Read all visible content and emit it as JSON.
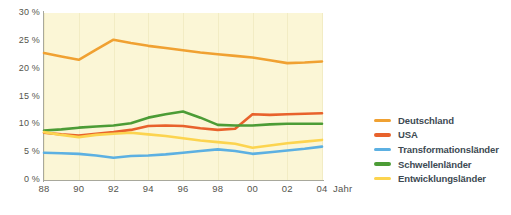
{
  "axes": {
    "y_ticks": [
      "30 %",
      "25 %",
      "20 %",
      "15 %",
      "10 %",
      "5 %",
      "0 %"
    ],
    "x_ticks": [
      "88",
      "90",
      "92",
      "94",
      "96",
      "98",
      "00",
      "02",
      "04"
    ],
    "x_title": "Jahr"
  },
  "legend": {
    "items": [
      {
        "label": "Deutschland",
        "color": "#f0a132"
      },
      {
        "label": "USA",
        "color": "#e8622c"
      },
      {
        "label": "Transformationsländer",
        "color": "#5cb0e2"
      },
      {
        "label": "Schwellenländer",
        "color": "#4c9c36"
      },
      {
        "label": "Entwicklungsländer",
        "color": "#fcd44f"
      }
    ]
  },
  "colors": {
    "plot_background": "#fbf6d6",
    "axis": "#a8a89c",
    "tick_text": "#55554d",
    "legend_text": "#3d4a52",
    "page_background": "#ffffff"
  },
  "chart_data": {
    "type": "line",
    "title": "",
    "xlabel": "Jahr",
    "ylabel": "",
    "grid": false,
    "legend_position": "right",
    "xlim": [
      1988,
      2004
    ],
    "ylim": [
      0,
      30
    ],
    "y_tick_values": [
      0,
      5,
      10,
      15,
      20,
      25,
      30
    ],
    "y_tick_labels": [
      "0 %",
      "5 %",
      "10 %",
      "15 %",
      "20 %",
      "25 %",
      "30 %"
    ],
    "x_tick_values": [
      1988,
      1990,
      1992,
      1994,
      1996,
      1998,
      2000,
      2002,
      2004
    ],
    "x_tick_labels": [
      "88",
      "90",
      "92",
      "94",
      "96",
      "98",
      "00",
      "02",
      "04"
    ],
    "x": [
      1988,
      1989,
      1990,
      1991,
      1992,
      1993,
      1994,
      1995,
      1996,
      1997,
      1998,
      1999,
      2000,
      2001,
      2002,
      2003,
      2004
    ],
    "series": [
      {
        "name": "Deutschland",
        "color": "#f0a132",
        "values": [
          22.8,
          22.2,
          21.6,
          23.4,
          25.2,
          24.6,
          24.1,
          23.7,
          23.3,
          22.9,
          22.6,
          22.3,
          22.0,
          21.5,
          21.0,
          21.1,
          21.3
        ]
      },
      {
        "name": "USA",
        "color": "#e8622c",
        "values": [
          8.5,
          8.2,
          8.0,
          8.3,
          8.6,
          9.0,
          9.7,
          9.8,
          9.7,
          9.3,
          9.0,
          9.2,
          11.8,
          11.7,
          11.8,
          11.9,
          12.0
        ]
      },
      {
        "name": "Transformationsländer",
        "color": "#5cb0e2",
        "values": [
          4.9,
          4.8,
          4.7,
          4.4,
          4.0,
          4.3,
          4.4,
          4.6,
          4.9,
          5.2,
          5.5,
          5.2,
          4.7,
          5.0,
          5.3,
          5.6,
          6.0
        ]
      },
      {
        "name": "Schwellenländer",
        "color": "#4c9c36",
        "values": [
          8.9,
          9.1,
          9.4,
          9.6,
          9.8,
          10.2,
          11.2,
          11.8,
          12.3,
          11.2,
          9.9,
          9.8,
          9.8,
          10.0,
          10.1,
          10.1,
          10.1
        ]
      },
      {
        "name": "Entwicklungsländer",
        "color": "#fcd44f",
        "values": [
          8.6,
          8.1,
          7.7,
          8.1,
          8.3,
          8.5,
          8.2,
          7.9,
          7.5,
          7.1,
          6.8,
          6.5,
          5.8,
          6.2,
          6.6,
          6.9,
          7.2
        ]
      }
    ]
  }
}
